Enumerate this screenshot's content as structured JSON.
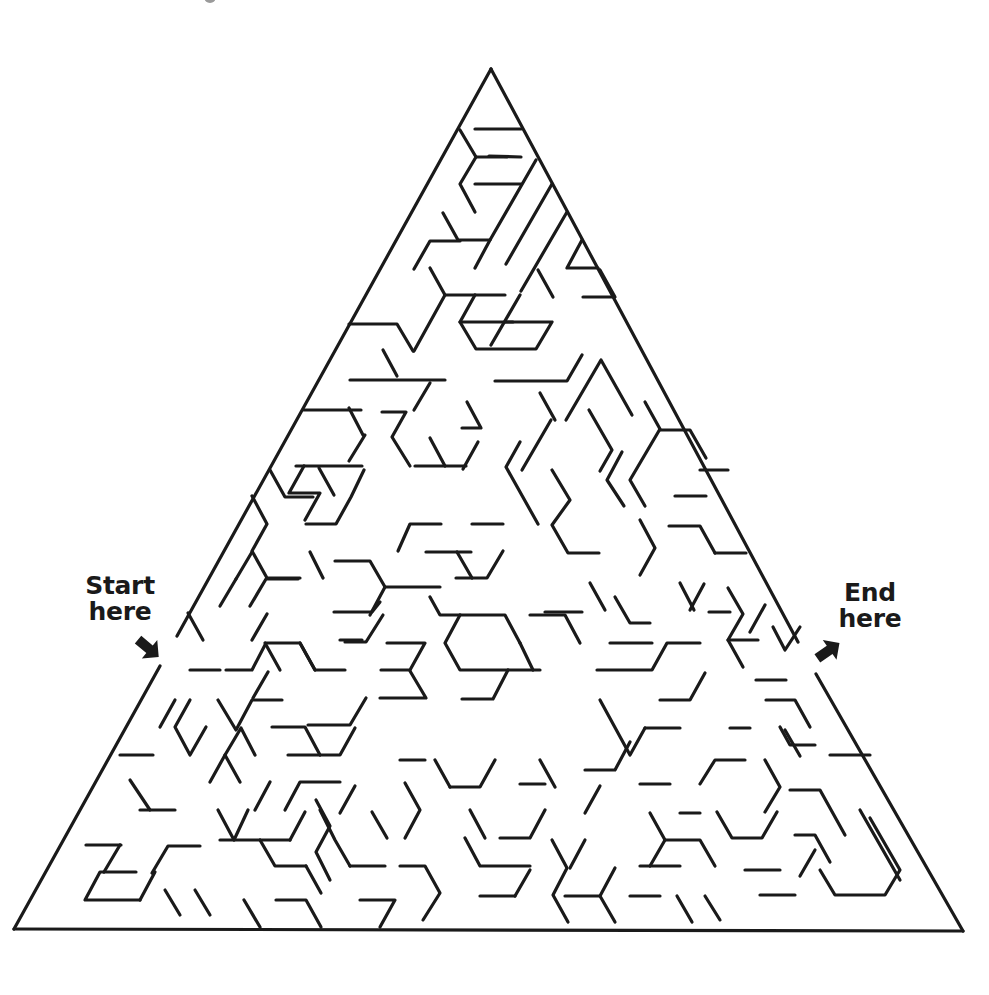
{
  "puzzle": {
    "type": "triangular-maze",
    "stroke_color": "#1a1a1a",
    "stroke_width": 3.2,
    "outer_triangle": {
      "top": [
        491,
        69
      ],
      "bottom_left": [
        14,
        929
      ],
      "bottom_right": [
        963,
        931
      ]
    },
    "start": {
      "label_line1": "Start",
      "label_line2": "here",
      "arrow_icon": "arrow-down-right",
      "arrow_position": [
        148,
        648
      ],
      "opening": [
        [
          177,
          636
        ],
        [
          160,
          666
        ]
      ]
    },
    "end": {
      "label_line1": "End",
      "label_line2": "here",
      "arrow_icon": "arrow-up-right",
      "arrow_position": [
        828,
        651
      ],
      "opening": [
        [
          798,
          642
        ],
        [
          816,
          674
        ]
      ]
    }
  },
  "walls": [
    "M460 130 L476 157 L460 184 L475 212",
    "M475 129 L521 129",
    "M476 157 L507 157",
    "M475 184 L521 184",
    "M489 156 L521 157",
    "M443 213 L458 240 L490 240 L536 160",
    "M552 184 L506 264",
    "M567 212 L521 291",
    "M460 241 L430 241 L414 269",
    "M490 240 L475 268",
    "M582 240 L567 268 L598 268",
    "M430 268 L445 295 L505 295",
    "M445 295 L414 351",
    "M460 322 L513 322",
    "M475 295 L460 322 L476 349 L536 349 L552 322 L505 322",
    "M538 270 L553 297",
    "M600 270 L615 297 L583 297",
    "M520 295 L491 345",
    "M349 324 L397 324 L413 351",
    "M383 350 L397 376",
    "M350 380 L445 380",
    "M430 383 L414 410",
    "M495 381 L567 381 L582 355",
    "M467 402 L481 428 L462 428",
    "M540 393 L555 420",
    "M566 420 L601 360 L632 415",
    "M349 408 L363 435",
    "M304 410 L361 410",
    "M296 466 L362 466",
    "M382 412 L406 412 L392 437 L410 466",
    "M319 468 L334 495",
    "M304 466 L289 493 L320 493 L305 520",
    "M365 435 L349 461",
    "M415 466 L466 466",
    "M430 438 L445 466",
    "M478 442 L463 469",
    "M520 442 L506 467 L538 524",
    "M551 420 L522 470",
    "M552 470 L570 500 L552 525 L568 553 L599 553",
    "M589 410 L612 450 L600 471",
    "M622 452 L607 480 L624 506",
    "M645 402 L660 429 L630 480 L645 506",
    "M660 430 L690 430 L706 458",
    "M675 496 L706 496",
    "M669 526 L700 526 L715 553",
    "M640 520 L655 548 L640 575",
    "M700 470 L728 470",
    "M715 553 L746 553",
    "M252 496 L267 524 L252 551 L267 578 L300 578",
    "M270 470 L285 497 L313 497",
    "M306 524 L336 524 L351 497 L364 470",
    "M310 552 L323 578",
    "M335 561 L370 561 L385 587 L440 587",
    "M385 587 L370 615",
    "M398 551 L410 524 L441 524",
    "M426 552 L471 552",
    "M472 524 L503 524",
    "M457 552 L472 578",
    "M456 578 L487 578 L503 551",
    "M220 606 L236 579",
    "M236 579 L252 552",
    "M250 606 L266 579 L298 579",
    "M188 613 L203 640",
    "M226 670 L252 670 L266 643 L300 643 L315 670 L345 670",
    "M252 640 L267 614",
    "M190 670 L220 670",
    "M334 612 L372 612 L380 602",
    "M340 640 L362 640",
    "M253 698 L268 672",
    "M218 700 L236 730 L252 700 L282 700",
    "M265 643 L280 670",
    "M300 643 L315 670",
    "M345 642 L366 642 L383 615",
    "M387 643 L425 643 L410 670 L381 670",
    "M410 671 L426 698 L380 698",
    "M366 698 L350 725 L308 725",
    "M430 597 L440 615 L505 615 L520 643",
    "M460 615 L445 643 L460 670 L540 670",
    "M462 699 L493 699 L508 670",
    "M530 615 L565 615 L580 643",
    "M520 643 L533 670",
    "M545 612 L582 612",
    "M590 583 L605 610",
    "M615 597 L630 623 L650 623",
    "M610 643 L652 643",
    "M597 670 L652 670 L667 643 L700 643",
    "M690 610 L704 584",
    "M680 583 L694 610",
    "M709 612 L730 612",
    "M728 588 L743 614 L728 640 L743 667",
    "M728 640 L758 640",
    "M765 605 L750 632",
    "M773 627 L785 650 L800 627",
    "M190 700 L175 727 L190 755 L206 727",
    "M160 727 L175 700",
    "M120 755 L153 755",
    "M130 780 L150 810",
    "M140 810 L175 810",
    "M86 845 L121 845",
    "M120 845 L104 872",
    "M136 872 L100 872 L85 900 L140 900",
    "M140 900 L155 872",
    "M152 873 L168 846 L200 846",
    "M165 890 L180 915",
    "M195 890 L210 915",
    "M225 755 L241 728 L255 755",
    "M210 782 L225 755 L240 782",
    "M272 727 L305 727 L320 755",
    "M288 755 L340 755 L355 728",
    "M270 782 L255 810",
    "M285 810 L300 782 L340 782",
    "M218 810 L234 840 L248 810",
    "M260 840 L275 866 L306 866",
    "M290 840 L305 812",
    "M220 840 L290 840",
    "M320 810 L335 840 L350 866",
    "M306 866 L321 893",
    "M276 900 L306 900 L321 927",
    "M244 900 L260 927",
    "M316 800 L330 826 L316 852 L330 880",
    "M350 866 L385 866",
    "M340 813 L355 786",
    "M372 812 L387 838",
    "M360 900 L395 900 L380 927",
    "M400 866 L425 866 L440 893 L423 920",
    "M405 783 L420 810 L405 838",
    "M435 760 L450 787",
    "M450 787 L480 787 L495 760",
    "M400 760 L425 760",
    "M465 838 L480 866 L530 866",
    "M470 810 L485 838",
    "M480 896 L515 896",
    "M515 896 L530 870",
    "M500 838 L530 838 L545 810",
    "M520 784 L545 784",
    "M540 760 L555 787",
    "M552 840 L567 868 L553 895 L568 922",
    "M585 840 L570 868",
    "M565 896 L600 896 L615 868",
    "M600 896 L615 922",
    "M585 813 L600 786",
    "M585 770 L615 770 L630 742",
    "M600 700 L630 755 L645 728",
    "M645 728 L680 728",
    "M660 700 L690 700 L705 673",
    "M640 784 L670 784",
    "M650 813 L665 840 L650 866",
    "M680 813 L700 813",
    "M665 840 L700 840 L715 866",
    "M640 866 L680 866",
    "M630 896 L660 896",
    "M677 896 L692 922",
    "M705 896 L720 920",
    "M700 784 L715 760 L745 760",
    "M730 728 L750 728",
    "M717 812 L732 838 L762 838 L777 812",
    "M745 870 L780 870",
    "M760 895 L795 895",
    "M765 760 L780 787 L765 812",
    "M766 700 L795 700 L810 727",
    "M780 727 L790 745 L815 745",
    "M756 680 L786 680",
    "M790 790 L820 790 L845 835",
    "M795 835 L815 835 L830 862",
    "M815 850 L800 876",
    "M820 870 L835 895 L885 895 L900 870 L870 818",
    "M860 810 L900 880",
    "M830 755 L870 755",
    "M800 756 L785 730"
  ]
}
